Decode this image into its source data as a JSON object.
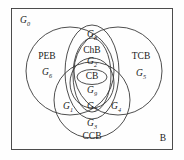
{
  "diagram": {
    "type": "venn-diagram",
    "universe_label": "B",
    "outer_region_label": "G0",
    "stroke_color": "#3a3a3a",
    "background_color": "#fefefe",
    "sets": [
      {
        "name": "PEB",
        "label": "PEB",
        "region_label": "G6"
      },
      {
        "name": "TCB",
        "label": "TCB",
        "region_label": "G5"
      },
      {
        "name": "CCB",
        "label": "CCB",
        "region_label": "G3"
      },
      {
        "name": "ChB",
        "label": "ChB",
        "region_label": "G2"
      },
      {
        "name": "CB",
        "label": "CB",
        "region_label": "G9"
      }
    ],
    "region_labels": [
      {
        "id": "G0",
        "text": "G0",
        "sub": "0",
        "base": "G",
        "x": 25,
        "y": 22,
        "style": "italic"
      },
      {
        "id": "G8",
        "text": "G8",
        "sub": "8",
        "base": "G",
        "x": 92,
        "y": 36,
        "style": "italic"
      },
      {
        "id": "G2",
        "text": "G2",
        "sub": "2",
        "base": "G",
        "x": 92,
        "y": 63,
        "style": "italic"
      },
      {
        "id": "G6",
        "text": "G6",
        "sub": "6",
        "base": "G",
        "x": 47,
        "y": 74,
        "style": "italic"
      },
      {
        "id": "G5",
        "text": "G5",
        "sub": "5",
        "base": "G",
        "x": 141,
        "y": 75,
        "style": "italic"
      },
      {
        "id": "G9",
        "text": "G9",
        "sub": "9",
        "base": "G",
        "x": 92,
        "y": 92,
        "style": "italic"
      },
      {
        "id": "G1",
        "text": "G1",
        "sub": "1",
        "base": "G",
        "x": 68,
        "y": 108,
        "style": "italic"
      },
      {
        "id": "G7",
        "text": "G7",
        "sub": "7",
        "base": "G",
        "x": 92,
        "y": 108,
        "style": "italic"
      },
      {
        "id": "G4",
        "text": "G4",
        "sub": "4",
        "base": "G",
        "x": 116,
        "y": 108,
        "style": "italic"
      },
      {
        "id": "G3",
        "text": "G3",
        "sub": "3",
        "base": "G",
        "x": 92,
        "y": 125,
        "style": "italic"
      }
    ],
    "set_labels": [
      {
        "id": "PEB",
        "text": "PEB",
        "x": 47,
        "y": 57,
        "style": "upright"
      },
      {
        "id": "ChB",
        "text": "ChB",
        "x": 92,
        "y": 51,
        "style": "upright"
      },
      {
        "id": "TCB",
        "text": "TCB",
        "x": 141,
        "y": 57,
        "style": "upright"
      },
      {
        "id": "CB",
        "text": "CB",
        "x": 92,
        "y": 77,
        "style": "upright"
      },
      {
        "id": "CCB",
        "text": "CCB",
        "x": 92,
        "y": 137,
        "style": "upright"
      },
      {
        "id": "B",
        "text": "B",
        "x": 163,
        "y": 139,
        "style": "upright"
      }
    ]
  }
}
